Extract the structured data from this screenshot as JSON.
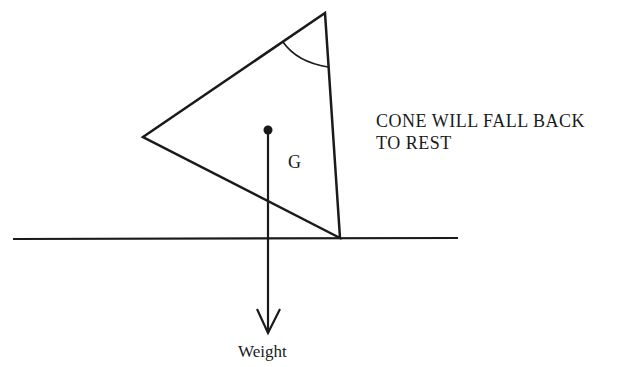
{
  "diagram": {
    "note_line1": "CONE WILL FALL BACK",
    "note_line2": "TO REST",
    "centroid_label": "G",
    "force_label": "Weight",
    "colors": {
      "ink": "#1a1a1a",
      "background": "#ffffff"
    },
    "shapes": {
      "cone_triangle": [
        [
          143,
          137
        ],
        [
          325,
          13
        ],
        [
          340,
          238
        ]
      ],
      "ground_line": [
        [
          13,
          239
        ],
        [
          458,
          238
        ]
      ],
      "centroid_point": [
        268,
        130
      ],
      "weight_arrow": {
        "from": [
          268,
          130
        ],
        "to": [
          268,
          333
        ]
      }
    }
  }
}
